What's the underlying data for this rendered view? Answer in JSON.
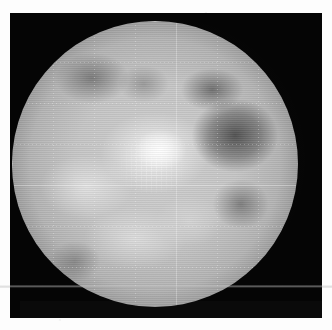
{
  "figure": {
    "kind": "planetary-disk-image",
    "caption": "",
    "panel": {
      "background_color": "#050505",
      "x": 10,
      "y": 13,
      "width": 312,
      "height": 305
    },
    "page_background_color": "#fdfdfd"
  },
  "disk": {
    "label": "planetary disk",
    "center_x": 155,
    "center_y": 164,
    "radius": 143,
    "colormap": "grayscale",
    "bright_value_color": "#ffffff",
    "mid_value_color": "#b4b4b4",
    "dark_value_color": "#3a3a3a",
    "background_color": "#050505"
  },
  "features": [
    {
      "name": "central-bright-region",
      "description": "brightest high-albedo area just above and right of disk centre",
      "relative_x": 0.52,
      "relative_y": 0.45,
      "brightness": "high"
    },
    {
      "name": "left-bright-region",
      "description": "secondary bright lobe on the left of disk centre",
      "relative_x": 0.26,
      "relative_y": 0.58,
      "brightness": "high"
    },
    {
      "name": "lower-bright-region",
      "description": "broad bright band across the lower hemisphere",
      "relative_x": 0.43,
      "relative_y": 0.76,
      "brightness": "medium-high"
    },
    {
      "name": "right-dark-patch",
      "description": "large dark low-albedo patch on the right half of the disk",
      "relative_x": 0.78,
      "relative_y": 0.4,
      "brightness": "low"
    },
    {
      "name": "upper-left-dark-patch",
      "description": "dark region near the upper-left limb",
      "relative_x": 0.28,
      "relative_y": 0.2,
      "brightness": "low"
    },
    {
      "name": "lower-right-dark-patch",
      "description": "dark region toward the lower-right limb",
      "relative_x": 0.8,
      "relative_y": 0.64,
      "brightness": "low"
    }
  ],
  "overlays": {
    "graticule": {
      "name": "dotted-coordinate-grid",
      "style": "dotted",
      "color": "#ffffff",
      "opacity": 0.3,
      "spacing_px": 41,
      "visible": true
    },
    "limb_ring": {
      "name": "speckled-limb-ring",
      "color": "#ffffff",
      "description": "bright dotted ring of points tracing the limb of the disk",
      "visible": true
    },
    "scan_band": {
      "name": "horizontal-scan-band",
      "color": "#cdcdcd",
      "y": 285,
      "height": 3,
      "description": "faint light horizontal line crossing the full width of the image",
      "visible": true
    }
  }
}
